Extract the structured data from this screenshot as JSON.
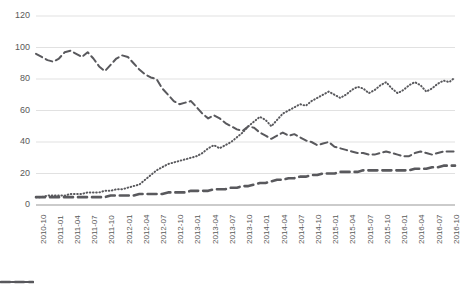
{
  "chart_data": {
    "type": "line",
    "title": "",
    "subtitle": "",
    "xlabel": "",
    "ylabel": "",
    "ylim": [
      0,
      120
    ],
    "yticks": [
      0,
      20,
      40,
      60,
      80,
      100,
      120
    ],
    "grid": true,
    "legend_position": "bottom",
    "legend": [
      {
        "name": "Series 1",
        "label": "",
        "style": "dashed-thin",
        "color": "#59595d"
      },
      {
        "name": "Series 2",
        "label": "",
        "style": "dashed-thick",
        "color": "#59595d"
      },
      {
        "name": "Series 3",
        "label": "",
        "style": "dotted",
        "color": "#59595d"
      }
    ],
    "x": [
      "2010-10",
      "2010-11",
      "2010-12",
      "2011-01",
      "2011-02",
      "2011-03",
      "2011-04",
      "2011-05",
      "2011-06",
      "2011-07",
      "2011-08",
      "2011-09",
      "2011-10",
      "2011-11",
      "2011-12",
      "2012-01",
      "2012-02",
      "2012-03",
      "2012-04",
      "2012-05",
      "2012-06",
      "2012-07",
      "2012-08",
      "2012-09",
      "2012-10",
      "2012-11",
      "2012-12",
      "2013-01",
      "2013-02",
      "2013-03",
      "2013-04",
      "2013-05",
      "2013-06",
      "2013-07",
      "2013-08",
      "2013-09",
      "2013-10",
      "2013-11",
      "2013-12",
      "2014-01",
      "2014-02",
      "2014-03",
      "2014-04",
      "2014-05",
      "2014-06",
      "2014-07",
      "2014-08",
      "2014-09",
      "2014-10",
      "2014-11",
      "2014-12",
      "2015-01",
      "2015-02",
      "2015-03",
      "2015-04",
      "2015-05",
      "2015-06",
      "2015-07",
      "2015-08",
      "2015-09",
      "2015-10",
      "2015-11",
      "2015-12",
      "2016-01",
      "2016-02",
      "2016-03",
      "2016-04",
      "2016-05",
      "2016-06",
      "2016-07",
      "2016-08",
      "2016-09",
      "2016-10",
      "2016-11"
    ],
    "xticks": [
      "2010-10",
      "2011-01",
      "2011-04",
      "2011-07",
      "2011-10",
      "2012-01",
      "2012-04",
      "2012-07",
      "2012-10",
      "2013-01",
      "2013-04",
      "2013-07",
      "2013-10",
      "2014-01",
      "2014-04",
      "2014-07",
      "2014-10",
      "2015-01",
      "2015-04",
      "2015-07",
      "2015-10",
      "2016-01",
      "2016-04",
      "2016-07",
      "2016-10"
    ],
    "series": [
      {
        "name": "Series 1",
        "style": "dashed-thin",
        "values": [
          96,
          94,
          92,
          91,
          93,
          97,
          98,
          96,
          94,
          97,
          93,
          88,
          85,
          89,
          93,
          95,
          94,
          90,
          86,
          83,
          81,
          80,
          74,
          70,
          66,
          64,
          65,
          66,
          62,
          58,
          55,
          57,
          55,
          52,
          50,
          48,
          47,
          50,
          49,
          46,
          44,
          42,
          44,
          46,
          44,
          45,
          43,
          41,
          40,
          38,
          39,
          40,
          37,
          36,
          35,
          34,
          33,
          33,
          32,
          32,
          33,
          34,
          33,
          32,
          31,
          31,
          33,
          34,
          33,
          32,
          33,
          34,
          34,
          34
        ]
      },
      {
        "name": "Series 2",
        "style": "dashed-thick",
        "values": [
          5,
          5,
          5,
          5,
          5,
          5,
          5,
          5,
          5,
          5,
          5,
          5,
          5,
          6,
          6,
          6,
          6,
          6,
          7,
          7,
          7,
          7,
          7,
          8,
          8,
          8,
          8,
          9,
          9,
          9,
          9,
          10,
          10,
          10,
          11,
          11,
          12,
          12,
          13,
          14,
          14,
          15,
          16,
          16,
          17,
          17,
          18,
          18,
          19,
          19,
          20,
          20,
          20,
          21,
          21,
          21,
          21,
          22,
          22,
          22,
          22,
          22,
          22,
          22,
          22,
          22,
          23,
          23,
          23,
          24,
          24,
          25,
          25,
          25
        ]
      },
      {
        "name": "Series 3",
        "style": "dotted",
        "values": [
          5,
          5,
          6,
          6,
          6,
          6,
          7,
          7,
          7,
          8,
          8,
          8,
          9,
          9,
          10,
          10,
          11,
          12,
          13,
          16,
          19,
          22,
          24,
          26,
          27,
          28,
          29,
          30,
          31,
          33,
          36,
          38,
          36,
          38,
          40,
          43,
          46,
          50,
          53,
          56,
          54,
          50,
          54,
          58,
          60,
          62,
          64,
          63,
          66,
          68,
          70,
          72,
          70,
          68,
          70,
          73,
          75,
          74,
          71,
          73,
          76,
          78,
          74,
          71,
          73,
          76,
          78,
          76,
          72,
          74,
          77,
          79,
          78,
          81
        ]
      }
    ]
  }
}
